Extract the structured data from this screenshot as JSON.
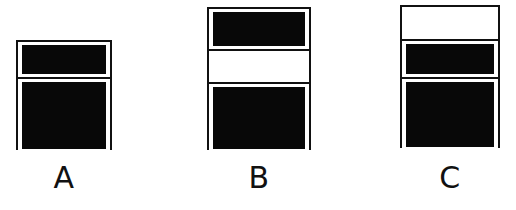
{
  "diagram": {
    "background_color": "#ffffff",
    "stroke_color": "#111111",
    "fill_color": "#080808",
    "empty_color": "#ffffff",
    "figures": [
      {
        "id": "A",
        "label": "A",
        "x": 16,
        "y": 40,
        "width": 96,
        "height": 110,
        "label_x": 40,
        "label_y": 163,
        "label_width": 48,
        "compartments": [
          {
            "name": "top",
            "height": 35,
            "filled": true,
            "state": "filled"
          },
          {
            "name": "bottom",
            "height": 75,
            "filled": true,
            "state": "filled"
          }
        ]
      },
      {
        "id": "B",
        "label": "B",
        "x": 207,
        "y": 7,
        "width": 104,
        "height": 143,
        "label_x": 235,
        "label_y": 163,
        "label_width": 48,
        "compartments": [
          {
            "name": "top",
            "height": 40,
            "filled": true,
            "state": "filled"
          },
          {
            "name": "middle",
            "height": 33,
            "filled": false,
            "state": "empty"
          },
          {
            "name": "bottom",
            "height": 70,
            "filled": true,
            "state": "filled"
          }
        ]
      },
      {
        "id": "C",
        "label": "C",
        "x": 400,
        "y": 5,
        "width": 100,
        "height": 143,
        "label_x": 426,
        "label_y": 163,
        "label_width": 48,
        "compartments": [
          {
            "name": "top",
            "height": 32,
            "filled": false,
            "state": "empty"
          },
          {
            "name": "middle",
            "height": 38,
            "filled": true,
            "state": "filled"
          },
          {
            "name": "bottom",
            "height": 73,
            "filled": true,
            "state": "filled"
          }
        ]
      }
    ]
  }
}
